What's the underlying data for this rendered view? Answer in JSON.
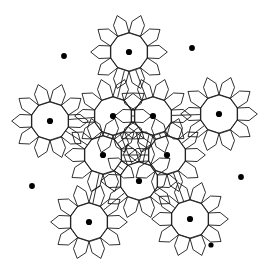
{
  "figure": {
    "type": "geometric-tiling-diagram",
    "width": 272,
    "height": 279,
    "background_color": "#ffffff",
    "stroke_color": "#1a1a1a",
    "stroke_width": 0.9,
    "fill_color": "none",
    "dot_color": "#000000"
  },
  "geometry": {
    "rosette_ring_radius": 19.5,
    "rosette_outer_radius": 38.5,
    "petal_inner_radius": 19.5,
    "dot_radius": 3.1,
    "small_dot_radius": 2.6,
    "isolated_dot_radius": 2.9,
    "ring_sides": 10,
    "petal_count": 10,
    "rosette_rotation_deg": 0
  },
  "rosettes": [
    {
      "name": "rosette-top",
      "cx": 129,
      "cy": 52,
      "rot": 0,
      "has_center_dot": true
    },
    {
      "name": "rosette-left-upper",
      "cx": 50,
      "cy": 121,
      "rot": 0,
      "has_center_dot": true
    },
    {
      "name": "rosette-mid-left",
      "cx": 113,
      "cy": 116,
      "rot": 0,
      "has_center_dot": true
    },
    {
      "name": "rosette-mid-right",
      "cx": 153,
      "cy": 116,
      "rot": 0,
      "has_center_dot": true
    },
    {
      "name": "rosette-right-upper",
      "cx": 219,
      "cy": 114,
      "rot": 0,
      "has_center_dot": true
    },
    {
      "name": "rosette-center-left",
      "cx": 103,
      "cy": 155,
      "rot": 0,
      "has_center_dot": true
    },
    {
      "name": "rosette-center-right",
      "cx": 167,
      "cy": 155,
      "rot": 0,
      "has_center_dot": true
    },
    {
      "name": "rosette-center-lower",
      "cx": 139,
      "cy": 181,
      "rot": 0,
      "has_center_dot": true
    },
    {
      "name": "rosette-bottom-left",
      "cx": 89,
      "cy": 222,
      "rot": 0,
      "has_center_dot": true
    },
    {
      "name": "rosette-bottom-right",
      "cx": 190,
      "cy": 219,
      "rot": 0,
      "has_center_dot": true
    }
  ],
  "center_dots": [
    {
      "name": "center-dot-top",
      "cx": 129,
      "cy": 52,
      "r": 3.1
    },
    {
      "name": "center-dot-left-upper",
      "cx": 50,
      "cy": 121,
      "r": 3.1
    },
    {
      "name": "center-dot-mid-left",
      "cx": 113,
      "cy": 116,
      "r": 3.1
    },
    {
      "name": "center-dot-mid-right",
      "cx": 153,
      "cy": 116,
      "r": 3.1
    },
    {
      "name": "center-dot-right-upper",
      "cx": 219,
      "cy": 114,
      "r": 3.1
    },
    {
      "name": "center-dot-center-left",
      "cx": 103,
      "cy": 155,
      "r": 3.1
    },
    {
      "name": "center-dot-center-right",
      "cx": 167,
      "cy": 155,
      "r": 3.1
    },
    {
      "name": "center-dot-center-lower",
      "cx": 139,
      "cy": 181,
      "r": 3.1
    },
    {
      "name": "center-dot-bottom-left",
      "cx": 89,
      "cy": 222,
      "r": 3.1
    },
    {
      "name": "center-dot-bottom-right",
      "cx": 190,
      "cy": 219,
      "r": 3.1
    }
  ],
  "satellite_dots": [
    {
      "name": "satellite-dot-pentagon-bottom-right",
      "cx": 211,
      "cy": 245,
      "r": 2.6
    }
  ],
  "isolated_dots": [
    {
      "name": "isolated-dot-top-left",
      "cx": 64,
      "cy": 56,
      "r": 2.9
    },
    {
      "name": "isolated-dot-top-right",
      "cx": 192,
      "cy": 48,
      "r": 2.9
    },
    {
      "name": "isolated-dot-left",
      "cx": 32,
      "cy": 186,
      "r": 2.9
    },
    {
      "name": "isolated-dot-right",
      "cx": 241,
      "cy": 177,
      "r": 2.9
    }
  ],
  "counts": {
    "rosettes": 10,
    "center_dots": 10,
    "isolated_dots": 4,
    "satellite_dots": 1,
    "total_dots": 15
  }
}
